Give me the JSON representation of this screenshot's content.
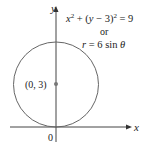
{
  "diagram": {
    "axes": {
      "x_label": "x",
      "y_label": "y",
      "origin_label": "0"
    },
    "circle": {
      "center_label": "(0, 3)",
      "equation_cartesian": "x² + (y − 3)² = 9",
      "connector": "or",
      "equation_polar": "r = 6 sin θ"
    },
    "colors": {
      "stroke": "#555555",
      "text": "#222222",
      "point": "#777777"
    }
  }
}
